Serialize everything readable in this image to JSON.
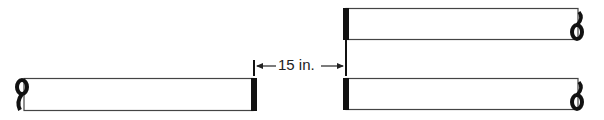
{
  "diagram": {
    "dimension_label": "15 in.",
    "colors": {
      "stroke": "#333333",
      "ink": "#111111",
      "background": "#ffffff"
    },
    "bars": [
      {
        "name": "left-bar",
        "loop_end": "left",
        "cap_end": "right"
      },
      {
        "name": "top-right-bar",
        "loop_end": "right",
        "cap_end": "left"
      },
      {
        "name": "bottom-right-bar",
        "loop_end": "right",
        "cap_end": "left"
      }
    ]
  }
}
